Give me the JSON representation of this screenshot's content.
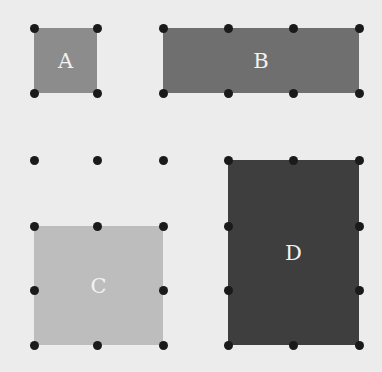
{
  "diagram": {
    "background": "#ececec",
    "dot_color": "#1a1a1a",
    "label_color": "#f2f2f2",
    "grid_x": [
      34,
      97,
      163,
      228,
      293,
      359
    ],
    "grid_y": [
      28,
      93,
      160,
      226,
      290,
      345
    ],
    "shapes": [
      {
        "label": "A",
        "color": "#8c8c8c",
        "x1": 34,
        "y1": 28,
        "x2": 97,
        "y2": 93,
        "dots": [
          [
            34,
            28
          ],
          [
            97,
            28
          ],
          [
            34,
            93
          ],
          [
            97,
            93
          ]
        ]
      },
      {
        "label": "B",
        "color": "#6f6f6f",
        "x1": 163,
        "y1": 28,
        "x2": 359,
        "y2": 93,
        "dots": [
          [
            163,
            28
          ],
          [
            228,
            28
          ],
          [
            293,
            28
          ],
          [
            359,
            28
          ],
          [
            163,
            93
          ],
          [
            228,
            93
          ],
          [
            293,
            93
          ],
          [
            359,
            93
          ]
        ]
      },
      {
        "label": "C",
        "color": "#bdbdbd",
        "x1": 34,
        "y1": 226,
        "x2": 163,
        "y2": 345,
        "dots": [
          [
            34,
            226
          ],
          [
            97,
            226
          ],
          [
            163,
            226
          ],
          [
            34,
            290
          ],
          [
            163,
            290
          ],
          [
            34,
            345
          ],
          [
            97,
            345
          ],
          [
            163,
            345
          ]
        ]
      },
      {
        "label": "D",
        "color": "#3e3e3e",
        "x1": 228,
        "y1": 160,
        "x2": 359,
        "y2": 345,
        "dots": [
          [
            228,
            160
          ],
          [
            293,
            160
          ],
          [
            359,
            160
          ],
          [
            228,
            226
          ],
          [
            359,
            226
          ],
          [
            228,
            290
          ],
          [
            359,
            290
          ],
          [
            228,
            345
          ],
          [
            293,
            345
          ],
          [
            359,
            345
          ]
        ]
      }
    ],
    "free_dots": [
      [
        34,
        160
      ],
      [
        97,
        160
      ],
      [
        163,
        160
      ]
    ]
  }
}
